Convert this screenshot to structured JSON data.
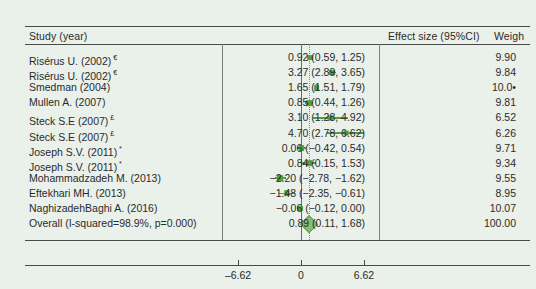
{
  "chart_data": {
    "type": "forest",
    "title": "",
    "columns": {
      "study": "Study (year)",
      "effect": "Effect size (95%CI)",
      "weight": "Weigh"
    },
    "xlabel": "",
    "ylabel": "",
    "xlim": [
      -8.2,
      8.2
    ],
    "xticks": [
      -6.62,
      0,
      6.62
    ],
    "xticklabels": [
      "–6.62",
      "0",
      "6.62"
    ],
    "null_line": 0,
    "pooled_line": 0.89,
    "grid": false,
    "legend": null,
    "accent_color": "#4f9e43",
    "diamond_color": "#86bd7c",
    "rows": [
      {
        "study": "Risérus U. (2002)",
        "mark": "€",
        "effect": "0.92 (0.59, 1.25)",
        "weight": "9.90",
        "es": 0.92,
        "lo": 0.59,
        "hi": 1.25,
        "w": 9.9
      },
      {
        "study": "Risérus U. (2002)",
        "mark": "€",
        "effect": "3.27 (2.89, 3.65)",
        "weight": "9.84",
        "es": 3.27,
        "lo": 2.89,
        "hi": 3.65,
        "w": 9.84
      },
      {
        "study": "Smedman (2004)",
        "mark": "",
        "effect": "1.65 (1.51, 1.79)",
        "weight": "10.0•",
        "es": 1.65,
        "lo": 1.51,
        "hi": 1.79,
        "w": 10.04
      },
      {
        "study": "Mullen A. (2007)",
        "mark": "",
        "effect": "0.85 (0.44, 1.26)",
        "weight": "9.81",
        "es": 0.85,
        "lo": 0.44,
        "hi": 1.26,
        "w": 9.81
      },
      {
        "study": "Steck S.E (2007)",
        "mark": "£",
        "effect": "3.10 (1.28, 4.92)",
        "weight": "6.52",
        "es": 3.1,
        "lo": 1.28,
        "hi": 4.92,
        "w": 6.52
      },
      {
        "study": "Steck S.E (2007)",
        "mark": "£",
        "effect": "4.70 (2.78, 6.62)",
        "weight": "6.26",
        "es": 4.7,
        "lo": 2.78,
        "hi": 6.62,
        "w": 6.26
      },
      {
        "study": "Joseph S.V. (2011)",
        "mark": "*",
        "effect": "0.06 (−0.42, 0.54)",
        "weight": "9.71",
        "es": 0.06,
        "lo": -0.42,
        "hi": 0.54,
        "w": 9.71
      },
      {
        "study": "Joseph S.V. (2011)",
        "mark": "*",
        "effect": "0.84 (0.15, 1.53)",
        "weight": "9.34",
        "es": 0.84,
        "lo": 0.15,
        "hi": 1.53,
        "w": 9.34
      },
      {
        "study": "Mohammadzadeh M. (2013)",
        "mark": "",
        "effect": "−2.20 (−2.78, −1.62)",
        "weight": "9.55",
        "es": -2.2,
        "lo": -2.78,
        "hi": -1.62,
        "w": 9.55
      },
      {
        "study": "Eftekhari MH. (2013)",
        "mark": "",
        "effect": "−1.48 (−2.35, −0.61)",
        "weight": "8.95",
        "es": -1.48,
        "lo": -2.35,
        "hi": -0.61,
        "w": 8.95
      },
      {
        "study": "NaghizadehBaghi A. (2016)",
        "mark": "",
        "effect": "−0.06 (−0.12, 0.00)",
        "weight": "10.07",
        "es": -0.06,
        "lo": -0.12,
        "hi": 0.0,
        "w": 10.07
      },
      {
        "study": "Overall (I-squared=98.9%, p=0.000)",
        "mark": "",
        "effect": "0.89 (0.11, 1.68)",
        "weight": "100.00",
        "es": 0.89,
        "lo": 0.11,
        "hi": 1.68,
        "w": 100.0,
        "overall": true
      }
    ]
  }
}
